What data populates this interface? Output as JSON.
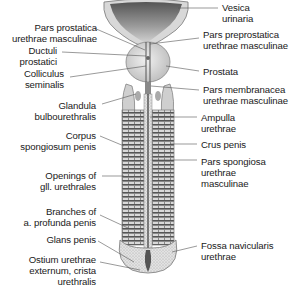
{
  "figure": {
    "type": "anatomical-illustration",
    "labels_left": [
      {
        "id": "pars-prostatica",
        "text": "Pars prostatica\nurethrae masculinae"
      },
      {
        "id": "ductuli-prostatici",
        "text": "Ductuli\nprostatici"
      },
      {
        "id": "colliculus-seminalis",
        "text": "Colliculus\nseminalis"
      },
      {
        "id": "glandula-bulbourethralis",
        "text": "Glandula\nbulbourethralis"
      },
      {
        "id": "corpus-spongiosum",
        "text": "Corpus\nspongiosum penis"
      },
      {
        "id": "openings-gll-urethrales",
        "text": "Openings of\ngll. urethrales"
      },
      {
        "id": "branches-a-profunda",
        "text": "Branches of\na. profunda penis"
      },
      {
        "id": "glans-penis",
        "text": "Glans penis"
      },
      {
        "id": "ostium-urethrae",
        "text": "Ostium urethrae\nexternum, crista\nurethralis"
      }
    ],
    "labels_right": [
      {
        "id": "vesica-urinaria",
        "text": "Vesica\nurinaria"
      },
      {
        "id": "pars-preprostatica",
        "text": "Pars preprostatica\nurethrae masculinae"
      },
      {
        "id": "prostata",
        "text": "Prostata"
      },
      {
        "id": "pars-membranacea",
        "text": "Pars membranacea\nurethrae masculinae"
      },
      {
        "id": "ampulla-urethrae",
        "text": "Ampulla\nurethrae"
      },
      {
        "id": "crus-penis",
        "text": "Crus penis"
      },
      {
        "id": "pars-spongiosa",
        "text": "Pars spongiosa\nurethrae\nmasculinae"
      },
      {
        "id": "fossa-navicularis",
        "text": "Fossa navicularis\nurethrae"
      }
    ],
    "colors": {
      "ink": "#1a1a1a",
      "leader": "#555555",
      "tissue_light": "#e6e6e6",
      "tissue_mid": "#bdbdbd",
      "tissue_dark": "#6e6e6e",
      "lumen": "#3a3a3a"
    }
  }
}
